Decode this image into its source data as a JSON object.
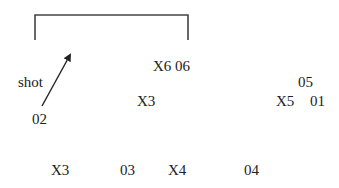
{
  "diagram": {
    "bracket": {
      "x1": 35,
      "x2": 188,
      "top": 15,
      "bottom": 40,
      "color": "#444444"
    },
    "arrow": {
      "from": [
        42,
        106
      ],
      "to": [
        72,
        52
      ],
      "color": "#222222"
    },
    "labels": {
      "shot": "shot",
      "o2": "02",
      "x6_o6": "X6 06",
      "x3_mid": "X3",
      "o5": "05",
      "x5": "X5",
      "o1": "01",
      "x3_bottom": "X3",
      "o3": "03",
      "x4": "X4",
      "o4": "04"
    }
  }
}
